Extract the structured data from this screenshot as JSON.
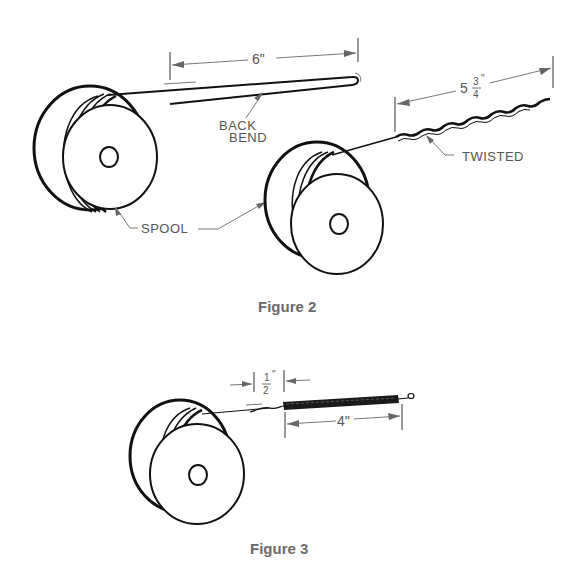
{
  "figures": [
    {
      "caption": "Figure 2",
      "labels": {
        "back_bend": [
          "BACK",
          "BEND"
        ],
        "spool": "SPOOL",
        "twisted": "TWISTED"
      },
      "dimensions": {
        "length_a": "6\"",
        "length_b_whole": "5",
        "length_b_num": "3",
        "length_b_den": "4",
        "length_b_inch": "\""
      }
    },
    {
      "caption": "Figure 3",
      "dimensions": {
        "gap_num": "1",
        "gap_den": "2",
        "gap_inch": "\"",
        "coil_length": "4\""
      }
    }
  ]
}
